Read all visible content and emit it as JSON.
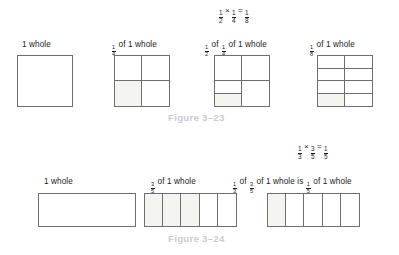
{
  "figures": [
    {
      "id": "figure-3-23",
      "caption": "Figure 3–23",
      "equation": {
        "left_num": "1",
        "left_den": "2",
        "operator": "×",
        "right_num": "1",
        "right_den": "4",
        "equals": "=",
        "result_num": "1",
        "result_den": "8"
      },
      "items": [
        {
          "name": "one-whole-square",
          "label_plain": "1 whole",
          "shape": "square",
          "cols": 1,
          "rows": 1,
          "shaded_cells": []
        },
        {
          "name": "one-fourth-square",
          "label_prefix_frac": {
            "num": "1",
            "den": "4"
          },
          "label_plain": " of 1 whole",
          "shape": "square",
          "cols": 2,
          "rows": 2,
          "shaded_cells": [
            2
          ]
        },
        {
          "name": "half-of-one-fourth-square",
          "label_prefix_frac": {
            "num": "1",
            "den": "2"
          },
          "label_mid": " of ",
          "label_mid_frac": {
            "num": "1",
            "den": "4"
          },
          "label_plain": " of 1 whole",
          "shape": "square",
          "cols": 2,
          "rows": 2,
          "split_cell": 2,
          "split_shaded_sub": 1,
          "shaded_cells": []
        },
        {
          "name": "one-eighth-square",
          "label_prefix_frac": {
            "num": "1",
            "den": "8"
          },
          "label_plain": " of 1 whole",
          "shape": "square",
          "cols": 2,
          "rows": 4,
          "shaded_cells": [
            6
          ]
        }
      ]
    },
    {
      "id": "figure-3-24",
      "caption": "Figure 3–24",
      "equation": {
        "left_num": "1",
        "left_den": "3",
        "operator": "×",
        "right_num": "3",
        "right_den": "5",
        "equals": "=",
        "result_num": "1",
        "result_den": "5"
      },
      "items": [
        {
          "name": "one-whole-rectangle",
          "label_plain": "1 whole",
          "shape": "rect",
          "cols": 1,
          "rows": 1,
          "shaded_cells": []
        },
        {
          "name": "three-fifths-rectangle",
          "label_prefix_frac": {
            "num": "3",
            "den": "5"
          },
          "label_plain": " of 1 whole",
          "shape": "rect",
          "cols": 5,
          "rows": 1,
          "shaded_cells": [
            0,
            1,
            2
          ]
        },
        {
          "name": "one-third-of-three-fifths-rectangle",
          "label_prefix_frac": {
            "num": "1",
            "den": "3"
          },
          "label_mid": " of ",
          "label_mid_frac": {
            "num": "3",
            "den": "5"
          },
          "label_mid2": " of 1 whole is ",
          "label_mid2_frac": {
            "num": "1",
            "den": "5"
          },
          "label_plain": " of 1 whole",
          "shape": "rect",
          "cols": 5,
          "rows": 1,
          "shaded_cells": [
            0
          ]
        }
      ]
    }
  ]
}
